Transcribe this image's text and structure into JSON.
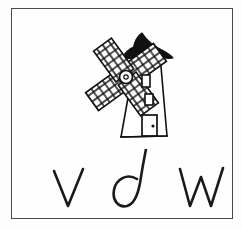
{
  "card": {
    "type": "handwriting-flashcard",
    "background_color": "#fdfdfd",
    "frame_color": "#4a4a4a",
    "ink_color": "#1a1a1a"
  },
  "illustration": {
    "name": "windmill",
    "label": "windmill",
    "parts": [
      {
        "name": "roof-cap",
        "fill": "#111111",
        "description": "solid black pointed cap"
      },
      {
        "name": "sail-upper-left",
        "fill": "none",
        "description": "lattice grid sail"
      },
      {
        "name": "sail-upper-right",
        "fill": "none",
        "description": "lattice grid sail"
      },
      {
        "name": "sail-lower-left",
        "fill": "none",
        "description": "lattice grid sail"
      },
      {
        "name": "sail-lower-right",
        "fill": "none",
        "description": "lattice grid sail"
      },
      {
        "name": "hub",
        "fill": "none",
        "description": "small circle at sail centre"
      },
      {
        "name": "tower-body",
        "fill": "#ffffff",
        "description": "tapered white tower"
      },
      {
        "name": "window-upper",
        "fill": "none",
        "description": "small rectangular window"
      },
      {
        "name": "window-lower",
        "fill": "none",
        "description": "small rectangular window"
      },
      {
        "name": "door",
        "fill": "none",
        "description": "rectangular door with knob"
      },
      {
        "name": "door-knob",
        "fill": "#111111",
        "description": "small dot"
      }
    ]
  },
  "letters": {
    "count": 3,
    "script": "handwritten-lowercase",
    "items": [
      {
        "char": "v",
        "name": "letter-v"
      },
      {
        "char": "d",
        "name": "letter-d"
      },
      {
        "char": "w",
        "name": "letter-w"
      }
    ],
    "joined": "v d w"
  }
}
